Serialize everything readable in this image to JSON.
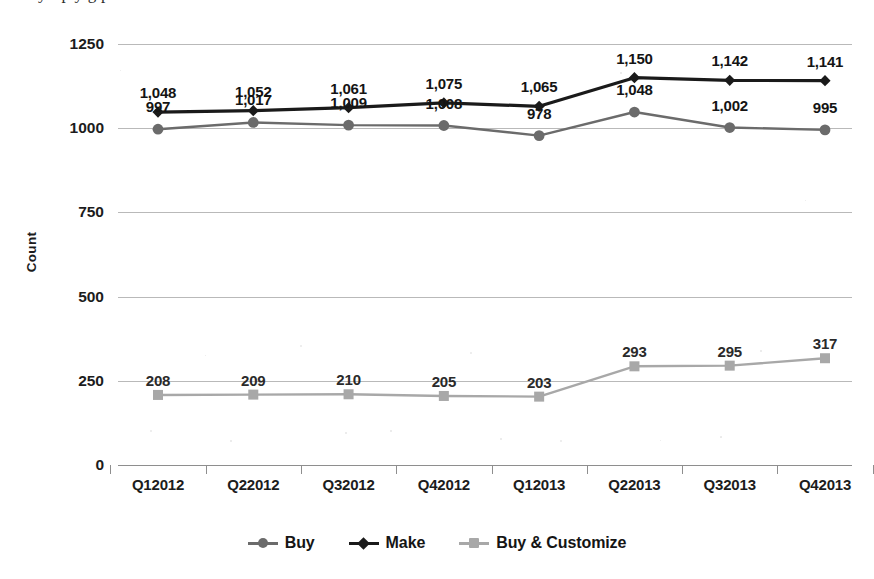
{
  "caption": {
    "cropped_line": "y   f   p y   g   p"
  },
  "chart_data": {
    "type": "line",
    "title": "",
    "xlabel": "",
    "ylabel": "Count",
    "ylim": [
      0,
      1250
    ],
    "yticks": [
      0,
      250,
      500,
      750,
      1000,
      1250
    ],
    "ytick_labels": [
      "0",
      "250",
      "500",
      "750",
      "1000",
      "1250"
    ],
    "grid": true,
    "legend_position": "bottom",
    "categories": [
      "Q12012",
      "Q22012",
      "Q32012",
      "Q42012",
      "Q12013",
      "Q22013",
      "Q32013",
      "Q42013"
    ],
    "series": [
      {
        "name": "Buy",
        "color": "#6b6b6b",
        "marker": "circle",
        "values": [
          997,
          1017,
          1009,
          1008,
          978,
          1048,
          1002,
          995
        ],
        "labels": [
          "997",
          "1,017",
          "1,009",
          "1,008",
          "978",
          "1,048",
          "1,002",
          "995"
        ]
      },
      {
        "name": "Make",
        "color": "#1a1a1a",
        "marker": "diamond",
        "values": [
          1048,
          1052,
          1061,
          1075,
          1065,
          1150,
          1142,
          1141
        ],
        "labels": [
          "1,048",
          "1,052",
          "1,061",
          "1,075",
          "1,065",
          "1,150",
          "1,142",
          "1,141"
        ]
      },
      {
        "name": "Buy & Customize",
        "color": "#a8a8a8",
        "marker": "square",
        "values": [
          208,
          209,
          210,
          205,
          203,
          293,
          295,
          317
        ],
        "labels": [
          "208",
          "209",
          "210",
          "205",
          "203",
          "293",
          "295",
          "317"
        ]
      }
    ]
  }
}
